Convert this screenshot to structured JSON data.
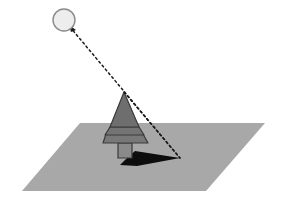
{
  "canvas": {
    "width": 282,
    "height": 204,
    "background": "#ffffff",
    "title": "Shadow projection of a tree from a point light source"
  },
  "colors": {
    "background": "#ffffff",
    "ground_plane": "#a8a8a8",
    "ground_plane_outline": "#a8a8a8",
    "light_source_fill": "#ededed",
    "light_source_outline": "#8a8a8a",
    "tree_tier_upper": "#6e6e6e",
    "tree_tier_middle": "#747474",
    "tree_tier_lower": "#787878",
    "tree_outline": "#3a3a3a",
    "trunk_fill": "#8a8a8a",
    "trunk_outline": "#3a3a3a",
    "shadow": "#0d0d0d",
    "ray_line": "#1a1a1a"
  },
  "elements": {
    "light_source": {
      "name": "light source",
      "shape": "circle",
      "center_x": 64,
      "center_y": 20,
      "radius": 11,
      "stroke_width": 1.4
    },
    "ground_plane": {
      "name": "ground plane",
      "shape": "parallelogram",
      "points": "80,123 265,123 206,191 22,191"
    },
    "tree": {
      "name": "conifer tree",
      "apex_x": 124,
      "apex_y": 92,
      "base_y": 143,
      "base_left_x": 103,
      "base_right_x": 148,
      "tiers": [
        {
          "label": "upper tier",
          "points": "124,92 110,127 139,127"
        },
        {
          "label": "middle tier",
          "points": "110,127 139,127 144,135 105,135"
        },
        {
          "label": "lower tier",
          "points": "106,134 143,134 148,143 103,143"
        }
      ],
      "trunk": {
        "label": "trunk",
        "points": "118,143 132,143 132,158 118,158"
      }
    },
    "shadow": {
      "name": "cast shadow",
      "points": "125,160 135,151 180,158 137,166 120,165"
    },
    "rays": [
      {
        "label": "ray grazing tree apex",
        "x1": 70,
        "y1": 27,
        "x2": 180,
        "y2": 158,
        "dash": "2,3",
        "width": 1.5
      },
      {
        "label": "ray along tree silhouette edge",
        "x1": 124,
        "y1": 92,
        "x2": 180,
        "y2": 158,
        "dash": "2,3",
        "width": 1.5
      }
    ],
    "arrowhead": {
      "name": "ray direction arrowhead",
      "points": "69,25 76,30 71,32",
      "tip_x": 69,
      "tip_y": 25
    }
  }
}
